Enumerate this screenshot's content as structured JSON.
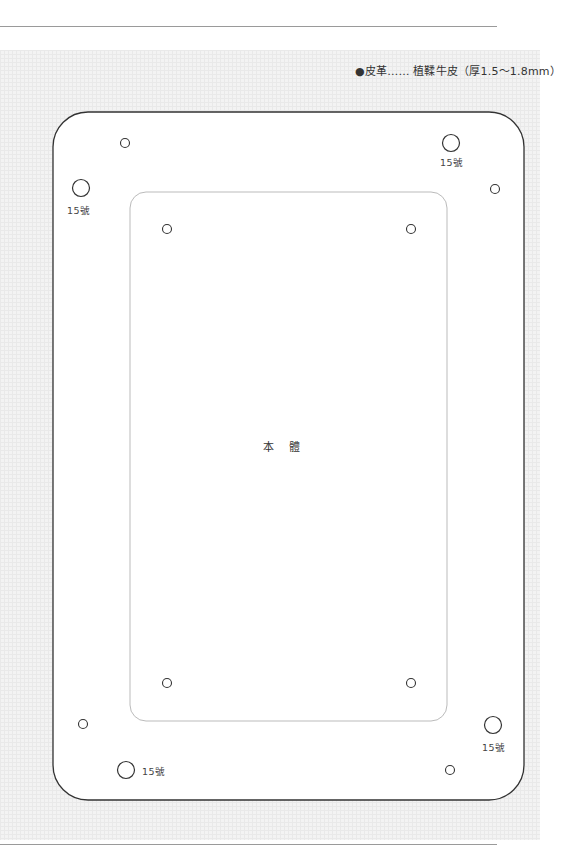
{
  "header": {
    "material_caption": "●皮革…… 植鞣牛皮（厚1.5～1.8mm）"
  },
  "pattern": {
    "outer_panel": {
      "x": 53,
      "y": 112,
      "width": 471,
      "height": 688,
      "radius": 35,
      "stroke": "#333333"
    },
    "inner_panel": {
      "x": 130,
      "y": 192,
      "width": 317,
      "height": 529,
      "radius": 16,
      "stroke": "#bbbbbb",
      "label": "本 體"
    },
    "small_holes": [
      {
        "cx": 125,
        "cy": 143
      },
      {
        "cx": 495,
        "cy": 189
      },
      {
        "cx": 167,
        "cy": 229
      },
      {
        "cx": 411,
        "cy": 229
      },
      {
        "cx": 167,
        "cy": 683
      },
      {
        "cx": 411,
        "cy": 683
      },
      {
        "cx": 83,
        "cy": 724
      },
      {
        "cx": 450,
        "cy": 770
      }
    ],
    "large_holes": [
      {
        "cx": 451,
        "cy": 143,
        "label": "15號",
        "label_x": 440,
        "label_y": 155
      },
      {
        "cx": 81,
        "cy": 188,
        "label": "15號",
        "label_x": 67,
        "label_y": 203
      },
      {
        "cx": 493,
        "cy": 725,
        "label": "15號",
        "label_x": 482,
        "label_y": 740
      },
      {
        "cx": 126,
        "cy": 770,
        "label": "15號",
        "label_x": 142,
        "label_y": 764
      }
    ]
  },
  "colors": {
    "rule": "#9a9a9a",
    "grid_background": "#f3f3f3",
    "outline": "#333333",
    "inner_outline": "#bbbbbb"
  }
}
